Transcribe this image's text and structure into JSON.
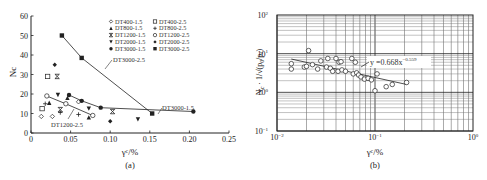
{
  "chart_data": [
    {
      "id": "a",
      "type": "scatter",
      "caption": "(a)",
      "xlabel": "γᶜ/%",
      "ylabel": "Nc",
      "xlim": [
        0,
        0.25
      ],
      "ylim": [
        0,
        60
      ],
      "xticks": [
        "0",
        "0.05",
        "0.10",
        "0.15",
        "0.20",
        "0.25"
      ],
      "yticks": [
        "0",
        "10",
        "20",
        "30",
        "40",
        "50",
        "60"
      ],
      "grid": false,
      "legend_position": "upper right",
      "series": [
        {
          "name": "DT400-1.5",
          "marker": "open-diamond",
          "x": [
            0.013,
            0.027,
            0.06
          ],
          "y": [
            8.5,
            8.5,
            16
          ]
        },
        {
          "name": "DT400-2.5",
          "marker": "open-square",
          "x": [
            0.014,
            0.021
          ],
          "y": [
            12.5,
            29
          ]
        },
        {
          "name": "DT800-1.5",
          "marker": "filled-triangle-up",
          "x": [
            0.023,
            0.046,
            0.073
          ],
          "y": [
            15.5,
            18,
            8
          ]
        },
        {
          "name": "DT800-2.5",
          "marker": "plus",
          "x": [
            0.018,
            0.037,
            0.06
          ],
          "y": [
            15,
            10.5,
            9.5
          ]
        },
        {
          "name": "DT1200-1.5",
          "marker": "x-star",
          "x": [
            0.033,
            0.037,
            0.103
          ],
          "y": [
            29,
            12,
            11
          ]
        },
        {
          "name": "DT1200-2.5",
          "marker": "open-circle",
          "x": [
            0.02,
            0.044,
            0.078
          ],
          "y": [
            19,
            15,
            9
          ],
          "line": true
        },
        {
          "name": "DT2000-1.5",
          "marker": "filled-triangle-down",
          "x": [
            0.034,
            0.073,
            0.135
          ],
          "y": [
            19.5,
            12.5,
            7
          ]
        },
        {
          "name": "DT2000-2.5",
          "marker": "filled-diamond",
          "x": [
            0.03,
            0.1
          ],
          "y": [
            35,
            6
          ]
        },
        {
          "name": "DT3000-1.5",
          "marker": "filled-circle",
          "x": [
            0.048,
            0.064,
            0.088,
            0.205
          ],
          "y": [
            19.5,
            16.5,
            13,
            11
          ],
          "line": true
        },
        {
          "name": "DT3000-2.5",
          "marker": "filled-square",
          "x": [
            0.039,
            0.064,
            0.153
          ],
          "y": [
            50,
            38.5,
            10
          ],
          "line": true
        }
      ],
      "annotations": [
        "DT3000-2.5",
        "DT3000-1.5",
        "DT1200-2.5"
      ]
    },
    {
      "id": "b",
      "type": "scatter",
      "caption": "(b)",
      "xlabel": "γᶜ/%",
      "ylabel": "Nc · 1/√(p0/pa)",
      "xscale": "log",
      "yscale": "log",
      "xlim": [
        0.01,
        1
      ],
      "ylim": [
        0.1,
        100
      ],
      "xticks": [
        "10⁻²",
        "10⁻¹",
        "10⁰"
      ],
      "yticks": [
        "10⁻¹",
        "10⁰",
        "10¹",
        "10²"
      ],
      "grid": true,
      "fit": {
        "equation": "y = 0.668x^-0.559",
        "a": 0.668,
        "b": -0.559,
        "x_range": [
          0.014,
          0.21
        ]
      },
      "x": [
        0.014,
        0.014,
        0.019,
        0.02,
        0.021,
        0.023,
        0.026,
        0.028,
        0.032,
        0.033,
        0.035,
        0.037,
        0.04,
        0.042,
        0.043,
        0.045,
        0.046,
        0.05,
        0.058,
        0.06,
        0.063,
        0.065,
        0.068,
        0.072,
        0.078,
        0.085,
        0.092,
        0.1,
        0.105,
        0.13,
        0.15,
        0.21
      ],
      "y": [
        5.5,
        4.0,
        4.5,
        4.7,
        12.0,
        5.2,
        4.0,
        6.5,
        4.5,
        7.5,
        4.2,
        3.5,
        7.5,
        3.5,
        6.0,
        6.2,
        3.8,
        3.5,
        7.5,
        3.0,
        6.0,
        3.2,
        2.8,
        2.5,
        2.2,
        2.3,
        2.1,
        1.1,
        3.0,
        1.4,
        1.6,
        1.8
      ]
    }
  ],
  "legend": {
    "items": [
      {
        "label": "DT400-1.5",
        "marker": "open-diamond"
      },
      {
        "label": "DT400-2.5",
        "marker": "open-square"
      },
      {
        "label": "DT800-1.5",
        "marker": "filled-triangle-up"
      },
      {
        "label": "DT800-2.5",
        "marker": "plus"
      },
      {
        "label": "DT1200-1.5",
        "marker": "x-star"
      },
      {
        "label": "DT1200-2.5",
        "marker": "open-circle"
      },
      {
        "label": "DT2000-1.5",
        "marker": "filled-triangle-down"
      },
      {
        "label": "DT2000-2.5",
        "marker": "filled-diamond"
      },
      {
        "label": "DT3000-1.5",
        "marker": "filled-circle"
      },
      {
        "label": "DT3000-2.5",
        "marker": "filled-square"
      }
    ]
  },
  "labels": {
    "a_caption": "(a)",
    "b_caption": "(b)",
    "a_ylabel": "Nc",
    "x_label": "γᶜ/%",
    "b_fit": "y =0.668x",
    "b_fit_exp": "−0.559",
    "ann_3000_25": "DT3000-2.5",
    "ann_3000_15": "DT3000-1.5",
    "ann_1200_25": "DT1200-2.5"
  },
  "colors": {
    "ink": "#222222",
    "grid": "#555555",
    "grid_light": "#9a9a9a",
    "background": "#ffffff"
  }
}
